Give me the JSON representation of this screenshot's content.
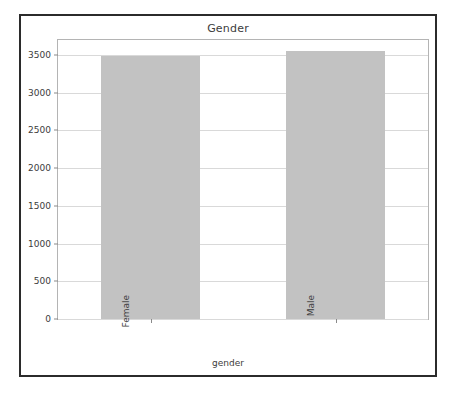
{
  "figure": {
    "background": "#ffffff",
    "border_color": "#2b2b2b",
    "plot_border_color": "#b4b4b4",
    "grid_color": "#d9d9d9",
    "bar_color": "#c2c2c2",
    "tick_color": "#8a8a8a",
    "text_color": "#3c3c3c"
  },
  "chart_data": {
    "type": "bar",
    "title": "Gender",
    "xlabel": "gender",
    "ylabel": "",
    "categories": [
      "Female",
      "Male"
    ],
    "values": [
      3490,
      3550
    ],
    "ylim": [
      0,
      3700
    ],
    "yticks": [
      0,
      500,
      1000,
      1500,
      2000,
      2500,
      3000,
      3500
    ],
    "ytick_labels": [
      "0",
      "500",
      "1000",
      "1500",
      "2000",
      "2500",
      "3000",
      "3500"
    ],
    "xtick_labels": [
      "Female",
      "Male"
    ],
    "xtick_rotation": 90,
    "grid": true,
    "grid_axis": "y",
    "legend": null,
    "legend_position": "none",
    "bar_color": "#c2c2c2",
    "series": [
      {
        "name": "count",
        "values": [
          3490,
          3550
        ]
      }
    ]
  }
}
